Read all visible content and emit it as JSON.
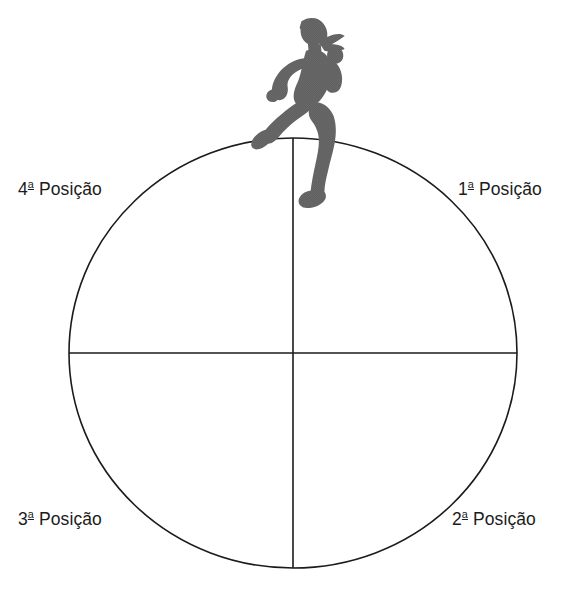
{
  "figure": {
    "name": "circle-quadrant-positions-diagram",
    "background_color": "#ffffff",
    "line_color": "#1b1b1b"
  },
  "runner": {
    "icon_name": "running-person-icon",
    "fill_color": "#595959",
    "description": "Silhueta de corredora"
  },
  "circle": {
    "center_x": 293,
    "center_y": 353,
    "radius_x": 224,
    "radius_y": 215,
    "stroke_width": 1.6
  },
  "axes": {
    "vertical_label": "vertical-diameter-line",
    "horizontal_label": "horizontal-diameter-line"
  },
  "labels": {
    "pos1": {
      "ordinal": "1",
      "suffix": "a",
      "text": "Posição",
      "full": "1ª Posição"
    },
    "pos2": {
      "ordinal": "2",
      "suffix": "a",
      "text": "Posição",
      "full": "2ª Posição"
    },
    "pos3": {
      "ordinal": "3",
      "suffix": "a",
      "text": "Posição",
      "full": "3ª Posição"
    },
    "pos4": {
      "ordinal": "4",
      "suffix": "a",
      "text": "Posição",
      "full": "4ª Posição"
    }
  }
}
